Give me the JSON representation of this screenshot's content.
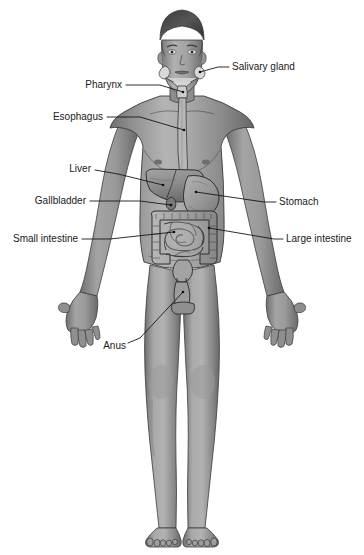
{
  "diagram": {
    "style": "grayscale medical illustration",
    "background_color": "#ffffff",
    "label_color": "#1a1a1a",
    "leader_line_color": "#161616",
    "labels": [
      {
        "id": "salivary-gland",
        "text": "Salivary gland",
        "side": "right",
        "text_x": 232,
        "text_y": 67,
        "leader": "M 218 67 L 229 67",
        "point_x": 200,
        "point_y": 72,
        "pointer": "M 200 72 L 218 67"
      },
      {
        "id": "pharynx",
        "text": "Pharynx",
        "side": "left",
        "text_x": 122,
        "text_y": 85,
        "leader": "M 126 85 L 160 85",
        "point_x": 183,
        "point_y": 92,
        "pointer": "M 160 85 L 183 92"
      },
      {
        "id": "esophagus",
        "text": "Esophagus",
        "side": "left",
        "text_x": 103,
        "text_y": 117,
        "leader": "M 107 117 L 140 117",
        "point_x": 184,
        "point_y": 130,
        "pointer": "M 140 117 L 184 130"
      },
      {
        "id": "liver",
        "text": "Liver",
        "side": "left",
        "text_x": 91,
        "text_y": 169,
        "leader": "M 95 170 L 118 174",
        "point_x": 163,
        "point_y": 185,
        "pointer": "M 118 174 L 163 185"
      },
      {
        "id": "gallbladder",
        "text": "Gallbladder",
        "side": "left",
        "text_x": 86,
        "text_y": 201,
        "leader": "M 90 201 L 140 201",
        "point_x": 171,
        "point_y": 205,
        "pointer": "M 140 201 L 171 205"
      },
      {
        "id": "stomach",
        "text": "Stomach",
        "side": "right",
        "text_x": 279,
        "text_y": 202,
        "leader": "M 264 202 L 276 202",
        "point_x": 196,
        "point_y": 192,
        "pointer": "M 196 192 L 264 202"
      },
      {
        "id": "small-intestine",
        "text": "Small intestine",
        "side": "left",
        "text_x": 78,
        "text_y": 239,
        "leader": "M 82 239 L 110 239",
        "point_x": 174,
        "point_y": 232,
        "pointer": "M 110 239 L 174 232"
      },
      {
        "id": "large-intestine",
        "text": "Large intestine",
        "side": "right",
        "text_x": 286,
        "text_y": 239,
        "leader": "M 274 239 L 283 239",
        "point_x": 209,
        "point_y": 228,
        "pointer": "M 209 228 L 274 239"
      },
      {
        "id": "anus",
        "text": "Anus",
        "side": "left",
        "text_x": 126,
        "text_y": 346,
        "leader": "M 128 343 L 140 338",
        "point_x": 183,
        "point_y": 292,
        "pointer": "M 140 338 L 183 292"
      }
    ],
    "organs": [
      {
        "id": "salivary-gland",
        "name": "Salivary gland"
      },
      {
        "id": "pharynx",
        "name": "Pharynx"
      },
      {
        "id": "esophagus",
        "name": "Esophagus"
      },
      {
        "id": "liver",
        "name": "Liver"
      },
      {
        "id": "gallbladder",
        "name": "Gallbladder"
      },
      {
        "id": "stomach",
        "name": "Stomach"
      },
      {
        "id": "small-intestine",
        "name": "Small intestine"
      },
      {
        "id": "large-intestine",
        "name": "Large intestine"
      },
      {
        "id": "rectum-anus",
        "name": "Anus"
      }
    ]
  }
}
